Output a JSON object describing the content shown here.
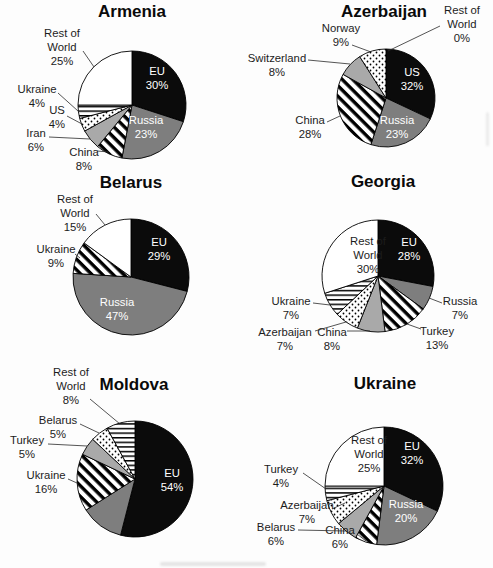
{
  "colors": {
    "slice_black": "#0b0b0b",
    "slice_gray": "#7e7e7e",
    "slice_light_gray": "#a9a9a9",
    "slice_white": "#ffffff",
    "outline": "#000000",
    "label_text": "#1c1c1c",
    "inside_label_on_dark": "#ffffff"
  },
  "chart_data": [
    {
      "type": "pie",
      "title": "Armenia",
      "start_angle": "12 o'clock",
      "direction": "clockwise",
      "slices": [
        {
          "label": "EU",
          "value": 30,
          "pct_text": "30%",
          "pattern": "solid-black",
          "label_placement": "inside"
        },
        {
          "label": "Russia",
          "value": 23,
          "pct_text": "23%",
          "pattern": "solid-gray",
          "label_placement": "inside"
        },
        {
          "label": "China",
          "value": 8,
          "pct_text": "8%",
          "pattern": "diagonal-stripes",
          "label_placement": "outside"
        },
        {
          "label": "Iran",
          "value": 6,
          "pct_text": "6%",
          "pattern": "solid-light-gray",
          "label_placement": "outside"
        },
        {
          "label": "US",
          "value": 4,
          "pct_text": "4%",
          "pattern": "dots",
          "label_placement": "outside"
        },
        {
          "label": "Ukraine",
          "value": 4,
          "pct_text": "4%",
          "pattern": "horizontal-lines",
          "label_placement": "outside"
        },
        {
          "label": "Rest of World",
          "value": 25,
          "pct_text": "25%",
          "pattern": "solid-white",
          "label_placement": "outside"
        }
      ]
    },
    {
      "type": "pie",
      "title": "Azerbaijan",
      "start_angle": "12 o'clock",
      "direction": "clockwise",
      "slices": [
        {
          "label": "US",
          "value": 32,
          "pct_text": "32%",
          "pattern": "solid-black",
          "label_placement": "inside"
        },
        {
          "label": "Russia",
          "value": 23,
          "pct_text": "23%",
          "pattern": "solid-gray",
          "label_placement": "inside"
        },
        {
          "label": "China",
          "value": 28,
          "pct_text": "28%",
          "pattern": "diagonal-stripes",
          "label_placement": "outside"
        },
        {
          "label": "Switzerland",
          "value": 8,
          "pct_text": "8%",
          "pattern": "solid-light-gray",
          "label_placement": "outside"
        },
        {
          "label": "Norway",
          "value": 9,
          "pct_text": "9%",
          "pattern": "dots",
          "label_placement": "outside"
        },
        {
          "label": "Rest of World",
          "value": 0,
          "pct_text": "0%",
          "pattern": "solid-white",
          "label_placement": "outside"
        }
      ]
    },
    {
      "type": "pie",
      "title": "Belarus",
      "start_angle": "12 o'clock",
      "direction": "clockwise",
      "slices": [
        {
          "label": "EU",
          "value": 29,
          "pct_text": "29%",
          "pattern": "solid-black",
          "label_placement": "inside"
        },
        {
          "label": "Russia",
          "value": 47,
          "pct_text": "47%",
          "pattern": "solid-gray",
          "label_placement": "inside"
        },
        {
          "label": "Ukraine",
          "value": 9,
          "pct_text": "9%",
          "pattern": "diagonal-stripes",
          "label_placement": "outside"
        },
        {
          "label": "Rest of World",
          "value": 15,
          "pct_text": "15%",
          "pattern": "solid-white",
          "label_placement": "outside"
        }
      ]
    },
    {
      "type": "pie",
      "title": "Georgia",
      "start_angle": "12 o'clock",
      "direction": "clockwise",
      "slices": [
        {
          "label": "EU",
          "value": 28,
          "pct_text": "28%",
          "pattern": "solid-black",
          "label_placement": "inside"
        },
        {
          "label": "Russia",
          "value": 7,
          "pct_text": "7%",
          "pattern": "solid-gray",
          "label_placement": "outside"
        },
        {
          "label": "Turkey",
          "value": 13,
          "pct_text": "13%",
          "pattern": "diagonal-stripes",
          "label_placement": "outside"
        },
        {
          "label": "China",
          "value": 8,
          "pct_text": "8%",
          "pattern": "solid-light-gray",
          "label_placement": "outside"
        },
        {
          "label": "Azerbaijan",
          "value": 7,
          "pct_text": "7%",
          "pattern": "dots",
          "label_placement": "outside"
        },
        {
          "label": "Ukraine",
          "value": 7,
          "pct_text": "7%",
          "pattern": "horizontal-lines",
          "label_placement": "outside"
        },
        {
          "label": "Rest of World",
          "value": 30,
          "pct_text": "30%",
          "pattern": "solid-white",
          "label_placement": "inside"
        }
      ]
    },
    {
      "type": "pie",
      "title": "Moldova",
      "start_angle": "12 o'clock",
      "direction": "clockwise",
      "slices": [
        {
          "label": "EU",
          "value": 54,
          "pct_text": "54%",
          "pattern": "solid-black",
          "label_placement": "inside"
        },
        {
          "label": "",
          "value": 12,
          "pct_text": "",
          "pattern": "solid-gray",
          "label_placement": "none"
        },
        {
          "label": "Ukraine",
          "value": 16,
          "pct_text": "16%",
          "pattern": "diagonal-stripes",
          "label_placement": "outside"
        },
        {
          "label": "Turkey",
          "value": 5,
          "pct_text": "5%",
          "pattern": "solid-light-gray",
          "label_placement": "outside"
        },
        {
          "label": "Belarus",
          "value": 5,
          "pct_text": "5%",
          "pattern": "dots",
          "label_placement": "outside"
        },
        {
          "label": "Rest of World",
          "value": 8,
          "pct_text": "8%",
          "pattern": "horizontal-lines",
          "label_placement": "outside"
        }
      ]
    },
    {
      "type": "pie",
      "title": "Ukraine",
      "start_angle": "12 o'clock",
      "direction": "clockwise",
      "slices": [
        {
          "label": "EU",
          "value": 32,
          "pct_text": "32%",
          "pattern": "solid-black",
          "label_placement": "inside"
        },
        {
          "label": "Russia",
          "value": 20,
          "pct_text": "20%",
          "pattern": "solid-gray",
          "label_placement": "inside"
        },
        {
          "label": "China",
          "value": 6,
          "pct_text": "6%",
          "pattern": "diagonal-stripes",
          "label_placement": "outside"
        },
        {
          "label": "Belarus",
          "value": 6,
          "pct_text": "6%",
          "pattern": "solid-light-gray",
          "label_placement": "outside"
        },
        {
          "label": "Azerbaijan",
          "value": 7,
          "pct_text": "7%",
          "pattern": "dots",
          "label_placement": "outside"
        },
        {
          "label": "Turkey",
          "value": 4,
          "pct_text": "4%",
          "pattern": "horizontal-lines",
          "label_placement": "outside"
        },
        {
          "label": "Rest of World",
          "value": 25,
          "pct_text": "25%",
          "pattern": "solid-white",
          "label_placement": "inside"
        }
      ]
    }
  ]
}
